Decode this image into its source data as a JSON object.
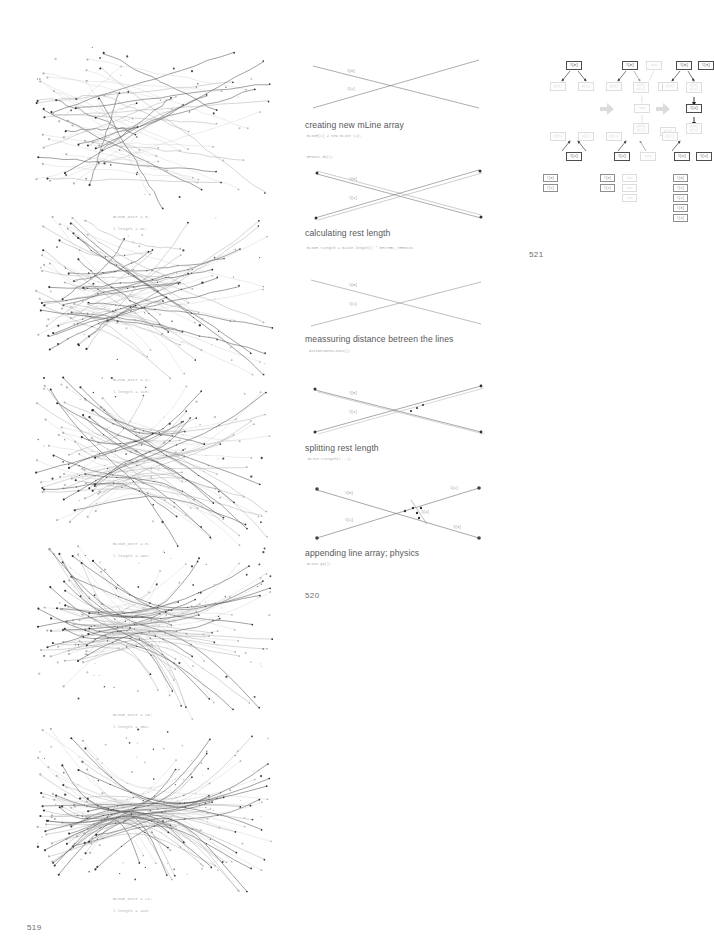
{
  "document": {
    "folio_left": "519",
    "folio_middle": "520",
    "folio_right": "521"
  },
  "plots": [
    {
      "name": "plot-mline-dist-3",
      "caption_line1": "mLINE_DIST = 3;",
      "caption_line2": "l.length = 81;",
      "dist": 3,
      "length": 81,
      "seed": 11
    },
    {
      "name": "plot-mline-dist-4",
      "caption_line1": "mLINE_DIST = 4;",
      "caption_line2": "l.length = 115;",
      "dist": 4,
      "length": 115,
      "seed": 23
    },
    {
      "name": "plot-mline-dist-8",
      "caption_line1": "mLINE_DIST = 8;",
      "caption_line2": "l.length = 198;",
      "dist": 8,
      "length": 198,
      "seed": 37
    },
    {
      "name": "plot-mline-dist-16",
      "caption_line1": "mLINE_DIST = 16;",
      "caption_line2": "l.length = 304;",
      "dist": 16,
      "length": 304,
      "seed": 53
    },
    {
      "name": "plot-mline-dist-24",
      "caption_line1": "mLINE_DIST = 24;",
      "caption_line2": "l.length = 443;",
      "dist": 24,
      "length": 443,
      "seed": 71
    }
  ],
  "steps": [
    {
      "name": "step-creating-array",
      "heading": "creating new mLine array",
      "code": "mLINE[i] = new mLine (2);",
      "labels": [
        "l[0]",
        "l[1]"
      ]
    },
    {
      "name": "step-rest-length",
      "heading": "calculating rest length",
      "code": "mLINE.rLength = mLine.length() * RESTREL_TERRIIN",
      "labels": [
        "l[0]",
        "l[1]"
      ],
      "pre_code": "mPoint.dx();"
    },
    {
      "name": "step-measuring-distance",
      "heading": "meassuring distance betreen the lines",
      "code": "distBetweenLines();",
      "labels": [
        "l[0]",
        "l[1]"
      ]
    },
    {
      "name": "step-splitting-rest-length",
      "heading": "splitting rest length",
      "code": "mLine.rLength(r...);",
      "labels": [
        "l[0]",
        "l[1]"
      ]
    },
    {
      "name": "step-appending-physics",
      "heading": "appending line array; physics",
      "code": "mLine.go();",
      "labels": [
        "l[0]",
        "l[1]",
        "l[2]",
        "l[3]",
        "l[4]"
      ]
    }
  ],
  "diagram": {
    "name": "node-transform-diagram",
    "stages": [
      {
        "name": "stage-1",
        "top": {
          "root": "l[0]",
          "children": [
            "p[0]",
            "p[1]"
          ]
        },
        "bottom": {
          "root": "l[1]",
          "children": [
            "p[0]",
            "p[1]"
          ]
        },
        "extra": []
      },
      {
        "name": "stage-2",
        "top": {
          "root": "l[0]",
          "children": [
            "p[0]",
            "p[0]\np[1]"
          ],
          "ghost_root": "new",
          "ghost_child": "p[1]"
        },
        "bottom": {
          "root": "l[1]",
          "children": [
            "p[0]\np[1]",
            "p[1]"
          ],
          "ghost_root": "new"
        },
        "middle_ghost": "new",
        "extra": []
      },
      {
        "name": "stage-3",
        "top": {
          "root": "l[0]",
          "children": [
            "p[0]",
            "p[0]\np[1]"
          ],
          "sibling_root": "l[3]",
          "sibling_child": "p[1]"
        },
        "center": "l[4]",
        "bottom": {
          "root": "l[1]",
          "children": [
            "p[0]\np[1]",
            "p[1]"
          ],
          "sibling_root": "l[2]"
        },
        "extra": []
      }
    ],
    "lists": [
      {
        "name": "list-before",
        "items": [
          "l[0]",
          "l[1]"
        ]
      },
      {
        "name": "list-middle",
        "items": [
          "l[0]",
          "l[1]"
        ],
        "ghosts": [
          "new",
          "new",
          "new"
        ]
      },
      {
        "name": "list-after",
        "items": [
          "l[0]",
          "l[1]",
          "l[2]",
          "l[3]",
          "l[4]"
        ]
      }
    ]
  }
}
